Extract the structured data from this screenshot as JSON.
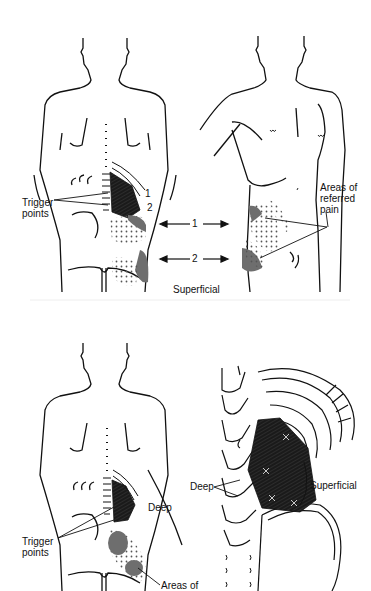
{
  "figure": {
    "panels": [
      {
        "id": "top-left",
        "view": "posterior torso",
        "labels": {
          "trigger_points": "Trigger\npoints",
          "num1": "1",
          "num2": "2"
        }
      },
      {
        "id": "top-right",
        "view": "anterior torso",
        "labels": {
          "referred_pain": "Areas of\nreferred\npain"
        }
      },
      {
        "id": "top-center",
        "labels": {
          "arrow1": "1",
          "arrow2": "2",
          "layer": "Superficial"
        }
      },
      {
        "id": "bottom-left",
        "view": "posterior torso",
        "labels": {
          "trigger_points": "Trigger\npoints",
          "deep": "Deep",
          "areas": "Areas of"
        }
      },
      {
        "id": "bottom-right",
        "view": "lumbar spine and quadratus lumborum detail",
        "labels": {
          "deep": "Deep",
          "superficial": "Superficial"
        }
      }
    ],
    "colors": {
      "line": "#111111",
      "muscle": "#1a1a1a",
      "shading": "#6e6e6e",
      "background": "#ffffff"
    }
  }
}
